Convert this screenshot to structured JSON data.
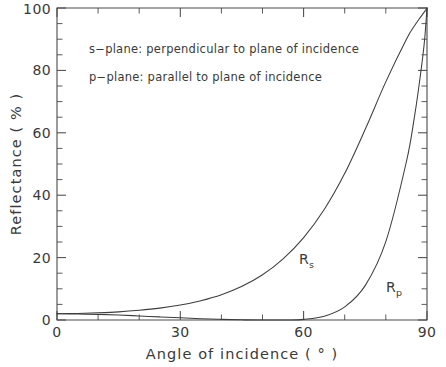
{
  "chart_data": {
    "type": "line",
    "title": "",
    "xlabel": "Angle of incidence ( ° )",
    "ylabel": "Reflectance ( % )",
    "xlim": [
      0,
      90
    ],
    "ylim": [
      0,
      100
    ],
    "xticks": [
      0,
      30,
      60,
      90
    ],
    "xticklabels": [
      "0",
      "30",
      "60",
      "90"
    ],
    "xminor_step": 10,
    "yticks": [
      0,
      20,
      40,
      60,
      80,
      100
    ],
    "yticklabels": [
      "0",
      "20",
      "40",
      "60",
      "80",
      "100"
    ],
    "yminor_step": 5,
    "grid": false,
    "legend_position": "inline-curve-labels",
    "annotations": [
      "s−plane: perpendicular to plane of incidence",
      "p−plane: parallel to plane of incidence"
    ],
    "series": [
      {
        "name": "Rs",
        "label": "R",
        "label_sub": "s",
        "x": [
          0,
          5,
          10,
          15,
          20,
          25,
          30,
          35,
          40,
          45,
          50,
          55,
          60,
          65,
          70,
          75,
          80,
          85,
          87,
          88,
          89,
          89.5,
          90
        ],
        "values": [
          2.0,
          2.1,
          2.3,
          2.6,
          3.1,
          3.8,
          4.8,
          6.2,
          8.1,
          10.8,
          14.5,
          19.6,
          26.4,
          35.4,
          47.0,
          61.2,
          76.4,
          90.0,
          94.4,
          96.3,
          98.1,
          99.0,
          100.0
        ]
      },
      {
        "name": "Rp",
        "label": "R",
        "label_sub": "p",
        "x": [
          0,
          5,
          10,
          15,
          20,
          25,
          30,
          35,
          40,
          45,
          50,
          55,
          56.3,
          60,
          65,
          70,
          75,
          80,
          85,
          87,
          88,
          89,
          89.5,
          90
        ],
        "values": [
          2.0,
          1.9,
          1.8,
          1.6,
          1.3,
          1.0,
          0.7,
          0.4,
          0.2,
          0.05,
          0.0,
          0.0,
          0.0,
          0.2,
          1.2,
          4.2,
          11.1,
          25.2,
          50.8,
          65.6,
          74.6,
          84.7,
          91.0,
          100.0
        ]
      }
    ]
  },
  "curve_labels": {
    "rs": {
      "base": "R",
      "sub": "s"
    },
    "rp": {
      "base": "R",
      "sub": "p"
    }
  },
  "axis": {
    "x_title": "Angle of incidence ( ° )",
    "y_title": "Reflectance ( % )"
  },
  "colors": {
    "line": "#3d3d3d",
    "axis": "#4a4a4a",
    "text": "#3a3a3a",
    "background": "#ffffff"
  }
}
